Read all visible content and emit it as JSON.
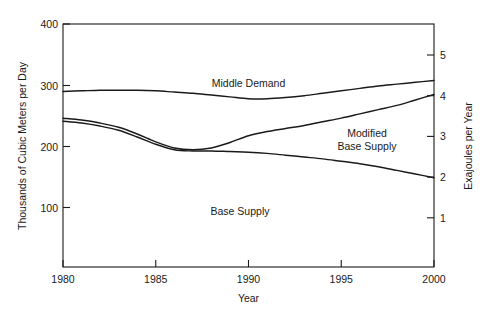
{
  "chart_data": {
    "type": "line",
    "title": "",
    "xlabel": "Year",
    "ylabel": "Thousands of Cubic Meters per Day",
    "y2label": "Exajoules per Year",
    "xlim": [
      1980,
      2000
    ],
    "ylim": [
      0,
      400
    ],
    "y2lim": [
      0,
      5.88
    ],
    "grid": false,
    "legend_position": "inline-annotations",
    "xticks": [
      "1980",
      "1985",
      "1990",
      "1995",
      "2000"
    ],
    "xtick_values": [
      1980,
      1985,
      1990,
      1995,
      2000
    ],
    "yticks": [
      "100",
      "200",
      "300",
      "400"
    ],
    "ytick_values": [
      100,
      200,
      300,
      400
    ],
    "y2ticks": [
      "1",
      "2",
      "3",
      "4",
      "5"
    ],
    "y2tick_values": [
      1,
      2,
      3,
      4,
      5
    ],
    "x": [
      1980,
      1981,
      1982,
      1983,
      1984,
      1985,
      1986,
      1987,
      1988,
      1989,
      1990,
      1991,
      1992,
      1993,
      1994,
      1995,
      1996,
      1997,
      1998,
      1999,
      2000
    ],
    "series": [
      {
        "name": "Middle Demand",
        "label": "Middle Demand",
        "label_x": 1990,
        "label_y": 295,
        "values": [
          289,
          290,
          291,
          291,
          291,
          290,
          288,
          286,
          283,
          280,
          277,
          277,
          279,
          282,
          286,
          290,
          294,
          298,
          301,
          304,
          307
        ]
      },
      {
        "name": "Modified Base Supply",
        "label": "Modified Base Supply",
        "label_x": 1995,
        "label_y": 228,
        "values": [
          245,
          242,
          237,
          230,
          219,
          206,
          196,
          193,
          196,
          205,
          216,
          223,
          228,
          233,
          239,
          245,
          252,
          259,
          266,
          275,
          284
        ]
      },
      {
        "name": "Base Supply",
        "label": "Base Supply",
        "label_x": 1989,
        "label_y": 157,
        "values": [
          240,
          237,
          232,
          225,
          214,
          202,
          193,
          191,
          191,
          190,
          189,
          187,
          184,
          181,
          178,
          174,
          170,
          165,
          159,
          153,
          147
        ]
      }
    ]
  },
  "colors": {
    "line": "#1a1a1a",
    "axis": "#1a1a1a",
    "background": "#ffffff"
  }
}
